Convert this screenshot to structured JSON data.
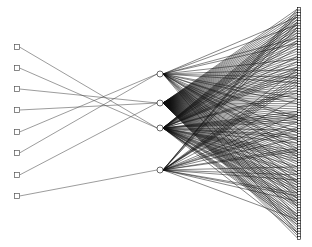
{
  "figure": {
    "kind": "network-graph",
    "title": "",
    "background_color": "#ffffff",
    "width": 312,
    "height": 247
  },
  "palette": {
    "edge_input_hidden": "#4a4a4a",
    "edge_hidden_output": "#111111",
    "node_input_fill": "#ffffff",
    "node_input_stroke": "#555555",
    "node_hidden_fill": "#ffffff",
    "node_hidden_stroke": "#2a2a2a",
    "node_output_fill": "#ffffff",
    "node_output_stroke": "#000000"
  },
  "layers": {
    "input": {
      "name": "input-layer",
      "count": 8,
      "x": 17,
      "node_shape": "square",
      "node_size": 5,
      "y_positions": [
        47,
        68,
        89,
        110,
        132,
        153,
        175,
        196
      ]
    },
    "hidden": {
      "name": "hidden-layer",
      "count": 4,
      "x": 160,
      "node_shape": "circle",
      "node_radius": 3,
      "y_positions": [
        74,
        103,
        128,
        170
      ]
    },
    "output": {
      "name": "output-layer",
      "count": 88,
      "x": 299,
      "node_shape": "square",
      "node_size": 3.2,
      "y_start": 9,
      "y_end": 238
    }
  },
  "edges": {
    "input_to_hidden": [
      {
        "from": 0,
        "to": 2
      },
      {
        "from": 1,
        "to": 2
      },
      {
        "from": 2,
        "to": 1
      },
      {
        "from": 3,
        "to": 1
      },
      {
        "from": 4,
        "to": 0
      },
      {
        "from": 5,
        "to": 0
      },
      {
        "from": 6,
        "to": 1
      },
      {
        "from": 7,
        "to": 3
      }
    ],
    "hidden_to_output_counts": [
      24,
      88,
      52,
      26
    ],
    "hidden_to_output_note": "dense fan-out from each hidden node to output column"
  }
}
